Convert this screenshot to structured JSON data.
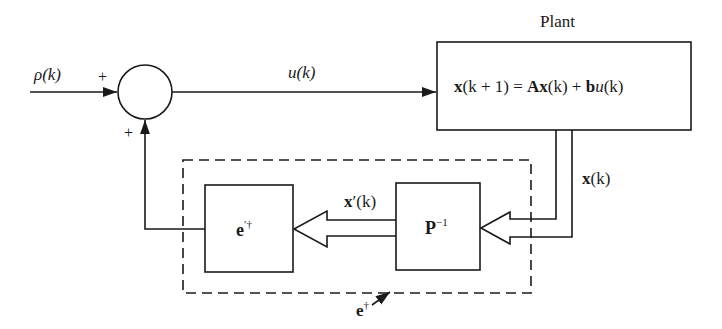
{
  "diagram": {
    "title": "Plant",
    "input_signal": "ρ(k)",
    "summing_junction": {
      "input_sign_left": "+",
      "input_sign_bottom": "+"
    },
    "control_signal": "u(k)",
    "plant": {
      "label": "Plant",
      "equation": {
        "lhs_vec": "x",
        "lhs_arg": "(k + 1) = ",
        "A": "A",
        "Ax_vec": "x",
        "Ax_arg": "(k) + ",
        "b": "b",
        "u": "u",
        "u_arg": "(k)"
      }
    },
    "state_signal": {
      "vec": "x",
      "arg": "(k)"
    },
    "transform_block": {
      "base": "P",
      "sup": "−1"
    },
    "transformed_state": {
      "vec": "x",
      "prime": "′",
      "arg": "(k)"
    },
    "gain_block": {
      "base": "e",
      "sup": "′†"
    },
    "dashed_group_label": {
      "base": "e",
      "sup": "†"
    },
    "colors": {
      "ink": "#1a1a1a",
      "background": "#ffffff"
    }
  }
}
